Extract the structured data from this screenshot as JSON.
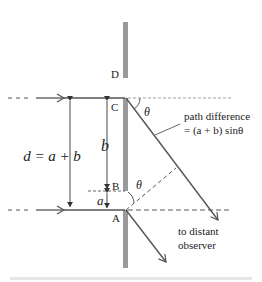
{
  "diagram": {
    "labels": {
      "point_D": "D",
      "point_C": "C",
      "point_B": "B",
      "point_A": "A",
      "theta_top": "θ",
      "theta_mid": "θ",
      "b": "b",
      "a": "a",
      "d_eq": "d = a + b",
      "path_diff_line1": "path difference",
      "path_diff_line2": "= (a + b) sinθ",
      "observer_line1": "to distant",
      "observer_line2": "observer"
    },
    "colors": {
      "barrier": "#9a9a9a",
      "line": "#555555",
      "text": "#222222"
    }
  }
}
